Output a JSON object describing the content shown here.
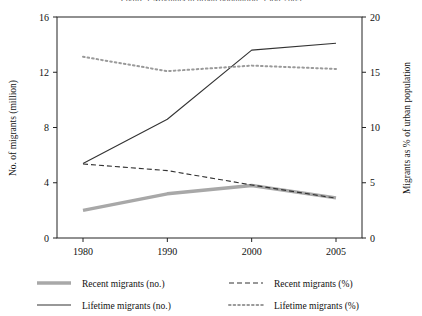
{
  "figure": {
    "title_clipped": "Figure 1  Migrants in urban population, 1980-2005",
    "background": "#ffffff"
  },
  "chart_data": {
    "type": "line",
    "title": "",
    "xlabel": "",
    "categories": [
      "1980",
      "1990",
      "2000",
      "2005"
    ],
    "x_tick_labels": [
      "1980",
      "1990",
      "2000",
      "2005"
    ],
    "grid": false,
    "legend_position": "bottom",
    "axes": {
      "left": {
        "label": "No. of migrants (million)",
        "ylim": [
          0,
          16
        ],
        "ticks": [
          0,
          4,
          8,
          12,
          16
        ],
        "tick_labels": [
          "0",
          "4",
          "8",
          "12",
          "16"
        ]
      },
      "right": {
        "label": "Migrants as % of urban population",
        "ylim": [
          0,
          20
        ],
        "ticks": [
          0,
          5,
          10,
          15,
          20
        ],
        "tick_labels": [
          "0",
          "5",
          "10",
          "15",
          "20"
        ]
      }
    },
    "series": [
      {
        "name": "Recent migrants (no.)",
        "axis": "left",
        "style": "solid",
        "width": "thick",
        "color": "#a8a8a8",
        "values": [
          2.0,
          3.2,
          3.8,
          2.9
        ]
      },
      {
        "name": "Lifetime migrants (no.)",
        "axis": "left",
        "style": "solid",
        "width": "thin",
        "color": "#333333",
        "values": [
          5.4,
          8.6,
          13.6,
          14.1
        ]
      },
      {
        "name": "Recent migrants (%)",
        "axis": "right",
        "style": "dashed",
        "width": "thin",
        "color": "#333333",
        "values": [
          6.7,
          6.1,
          4.8,
          3.6
        ]
      },
      {
        "name": "Lifetime migrants (%)",
        "axis": "right",
        "style": "dotted",
        "width": "thin",
        "color": "#9a9a9a",
        "values": [
          16.4,
          15.1,
          15.6,
          15.3
        ]
      }
    ]
  },
  "legend": {
    "entries": [
      {
        "label": "Recent migrants (no.)"
      },
      {
        "label": "Recent migrants (%)"
      },
      {
        "label": "Lifetime migrants (no.)"
      },
      {
        "label": "Lifetime migrants (%)"
      }
    ]
  }
}
